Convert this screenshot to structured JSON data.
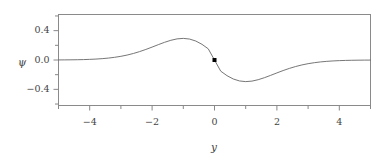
{
  "chart_data": {
    "type": "line",
    "title": "",
    "subtitle": "",
    "xlabel": "y",
    "ylabel": "ψ",
    "xlim": [
      -5,
      5
    ],
    "ylim": [
      -0.62,
      0.62
    ],
    "grid": false,
    "legend": null,
    "background_color": "#ffffff",
    "frame_color": "#888888",
    "line_color": "#666666",
    "marker_color": "#000000",
    "x_ticks_major": [
      -4,
      -2,
      0,
      2,
      4
    ],
    "x_tick_labels": [
      "−4",
      "−2",
      "0",
      "2",
      "4"
    ],
    "y_ticks_major": [
      -0.4,
      0.0,
      0.4
    ],
    "y_tick_labels": [
      "−0.4",
      "0.0",
      "0.4"
    ],
    "y_ticks_minor": [
      -0.6,
      -0.2,
      0.2,
      0.6
    ],
    "x_ticks_minor": [
      -5,
      -3,
      -1,
      1,
      3,
      5
    ],
    "series": [
      {
        "name": "psi",
        "description": "odd function, negated Gaussian derivative shape",
        "x": [
          -5.0,
          -4.8,
          -4.6,
          -4.4,
          -4.2,
          -4.0,
          -3.8,
          -3.6,
          -3.4,
          -3.2,
          -3.0,
          -2.8,
          -2.6,
          -2.4,
          -2.2,
          -2.0,
          -1.8,
          -1.6,
          -1.4,
          -1.2,
          -1.0,
          -0.8,
          -0.6,
          -0.4,
          -0.2,
          0.0,
          0.2,
          0.4,
          0.6,
          0.8,
          1.0,
          1.2,
          1.4,
          1.6,
          1.8,
          2.0,
          2.2,
          2.4,
          2.6,
          2.8,
          3.0,
          3.2,
          3.4,
          3.6,
          3.8,
          4.0,
          4.2,
          4.4,
          4.6,
          4.8,
          5.0
        ],
        "y": [
          0.0009,
          0.0015,
          0.0024,
          0.0037,
          0.0057,
          0.0086,
          0.0127,
          0.0184,
          0.0262,
          0.0366,
          0.0502,
          0.0675,
          0.0889,
          0.1145,
          0.1438,
          0.1759,
          0.2092,
          0.2411,
          0.2685,
          0.2877,
          0.2945,
          0.2855,
          0.2585,
          0.2133,
          0.1523,
          0.0,
          -0.1523,
          -0.2133,
          -0.2585,
          -0.2855,
          -0.2945,
          -0.2877,
          -0.2685,
          -0.2411,
          -0.2092,
          -0.1759,
          -0.1438,
          -0.1145,
          -0.0889,
          -0.0675,
          -0.0502,
          -0.0366,
          -0.0262,
          -0.0184,
          -0.0127,
          -0.0086,
          -0.0057,
          -0.0037,
          -0.0024,
          -0.0015,
          -0.0009
        ],
        "extrema": {
          "minimum": {
            "x": -1.0,
            "y": -0.22
          },
          "maximum": {
            "x": 1.0,
            "y": 0.22
          }
        }
      }
    ],
    "markers": [
      {
        "name": "origin-point",
        "x": 0,
        "y": 0,
        "shape": "square",
        "color": "#000000",
        "size": 4
      }
    ]
  }
}
